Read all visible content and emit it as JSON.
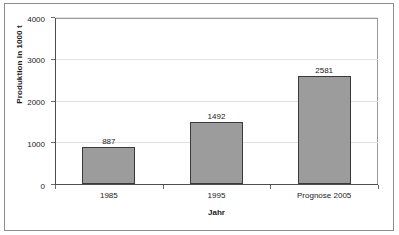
{
  "chart_data": {
    "type": "bar",
    "title": "",
    "categories": [
      "1985",
      "1995",
      "Prognose 2005"
    ],
    "values": [
      887,
      1492,
      2581
    ],
    "value_labels": [
      "887",
      "1492",
      "2581"
    ],
    "xlabel": "Jahr",
    "ylabel": "Produktion in 1000 t",
    "ylim": [
      0,
      4000
    ],
    "yticks": [
      0,
      1000,
      2000,
      3000,
      4000
    ],
    "ytick_labels": [
      "0",
      "1000",
      "2000",
      "3000",
      "4000"
    ],
    "grid": true,
    "grid_axis": "y",
    "legend": false,
    "legend_position": "none",
    "bar_fill_color": "#9c9c9c",
    "bar_border_color": "#3a3a3a",
    "gridline_color": "#e2e2e2",
    "axis_color": "#4d4d4d",
    "frame_color": "#8c8c8c",
    "text_color": "#1a1a1a",
    "background_color": "#ffffff",
    "show_value_labels": true
  }
}
